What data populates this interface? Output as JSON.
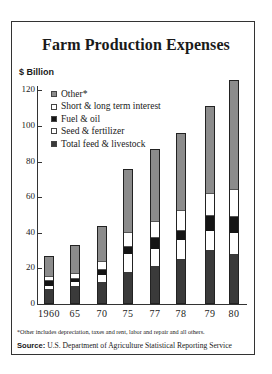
{
  "chart_data": {
    "type": "bar",
    "stacked": true,
    "title": "Farm Production Expenses",
    "xlabel": "",
    "ylabel": "$ Billion",
    "ylim": [
      0,
      130
    ],
    "yticks": [
      0,
      20,
      40,
      60,
      80,
      100,
      120
    ],
    "grid": false,
    "legend_position": "upper left",
    "categories": [
      "1960",
      "65",
      "70",
      "75",
      "77",
      "78",
      "79",
      "80"
    ],
    "series": [
      {
        "name": "Total feed & livestock",
        "values": [
          8,
          10,
          12,
          18,
          21,
          25,
          30,
          28
        ]
      },
      {
        "name": "Seed & fertilizer",
        "values": [
          2,
          2,
          4,
          10,
          10,
          11,
          11,
          12
        ]
      },
      {
        "name": "Fuel & oil",
        "values": [
          3,
          2,
          3,
          4,
          6,
          5,
          8,
          9
        ]
      },
      {
        "name": "Short & long term interest",
        "values": [
          2,
          3,
          5,
          8,
          9,
          11,
          13,
          15
        ]
      },
      {
        "name": "Other*",
        "values": [
          12,
          16,
          20,
          36,
          41,
          44,
          49,
          62
        ]
      }
    ],
    "totals": [
      27,
      33,
      44,
      76,
      87,
      96,
      111,
      126
    ],
    "footnote": "*Other includes depreciation, taxes and rent, labor and repair and all others.",
    "source_label": "Source:",
    "source_text": "U.S. Department of Agriculture Statistical Reporting Service"
  },
  "legend": [
    {
      "label": "Other*",
      "key": "other"
    },
    {
      "label": "Short & long term interest",
      "key": "interest"
    },
    {
      "label": "Fuel & oil",
      "key": "fuel"
    },
    {
      "label": "Seed & fertilizer",
      "key": "seed"
    },
    {
      "label": "Total feed & livestock",
      "key": "feed"
    }
  ],
  "colors": {
    "other": "#8c8c8c",
    "interest": "#ffffff",
    "fuel": "#151515",
    "seed": "#ffffff",
    "feed": "#3a3a3a"
  }
}
